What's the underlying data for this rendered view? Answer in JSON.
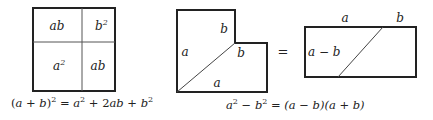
{
  "figure": {
    "square_diagram": {
      "cells": {
        "top_left": "ab",
        "top_right_base": "b",
        "top_right_exp": "2",
        "bottom_left_base": "a",
        "bottom_left_exp": "2",
        "bottom_right": "ab"
      },
      "caption": {
        "lhs_open": "(",
        "lhs_a": "a",
        "lhs_plus": " + ",
        "lhs_b": "b",
        "lhs_close": ")",
        "lhs_exp": "2",
        "equals": " = ",
        "t1": "a",
        "t1_exp": "2",
        "plus1": " + 2",
        "t2": "ab",
        "plus2": " + ",
        "t3": "b",
        "t3_exp": "2"
      }
    },
    "l_shape_diagram": {
      "labels": {
        "top_inner_b": "b",
        "left_a": "a",
        "step_b": "b",
        "bottom_a": "a"
      }
    },
    "equals_sign": "=",
    "rectangle_diagram": {
      "labels": {
        "top_a": "a",
        "top_b": "b",
        "left_a_minus_b": "a − b"
      }
    },
    "bottom_caption": {
      "a": "a",
      "a_exp": "2",
      "minus": " − ",
      "b": "b",
      "b_exp": "2",
      "rest": " = (a − b)(a + b)"
    }
  }
}
